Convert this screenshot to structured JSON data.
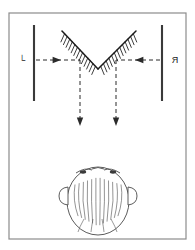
{
  "figure": {
    "type": "optics-ray-diagram",
    "canvas": {
      "width": 195,
      "height": 250
    },
    "background_color": "#ffffff",
    "frame": {
      "name": "figure-border",
      "x": 9,
      "y": 13,
      "width": 177,
      "height": 226,
      "stroke": "#8c8c8c",
      "stroke_width": 1.2,
      "fill": "none"
    },
    "ink_color": "#1a1a1a",
    "ray_color": "#2b2b2b",
    "labels": {
      "left": "└",
      "right": "Я",
      "left_name": "left-object-label-L",
      "right_name": "right-object-label-reversed-R"
    },
    "screens": [
      {
        "name": "left-screen",
        "x": 34,
        "y_top": 25,
        "y_bottom": 101,
        "stroke": "#3a3a3a",
        "stroke_width": 2.1
      },
      {
        "name": "right-screen",
        "x": 162,
        "y_top": 25,
        "y_bottom": 101,
        "stroke": "#3a3a3a",
        "stroke_width": 2.1
      }
    ],
    "mirror": {
      "name": "v-roof-mirror",
      "apex": {
        "x": 98,
        "y": 69
      },
      "left_end": {
        "x": 62,
        "y": 31
      },
      "right_end": {
        "x": 136,
        "y": 31
      },
      "stroke": "#1a1a1a",
      "stroke_width": 1.5,
      "hatch_count": 13,
      "hatch_length": 9,
      "hatch_stroke_width": 0.85,
      "hatch_side": "inner"
    },
    "rays": {
      "horizontal_axis_y": 60,
      "incoming_left": {
        "name": "incoming-ray-left",
        "x_start": 36,
        "x_end": 80,
        "direction": "right",
        "arrow_x": 58,
        "dash": "4,3"
      },
      "incoming_right": {
        "name": "incoming-ray-right",
        "x_start": 160,
        "x_end": 116,
        "direction": "left",
        "arrow_x": 138,
        "dash": "4,3"
      },
      "outgoing_left": {
        "name": "outgoing-ray-left",
        "x": 80,
        "y_start": 60,
        "y_end": 126,
        "direction": "down",
        "dash": "4,3"
      },
      "outgoing_right": {
        "name": "outgoing-ray-right",
        "x": 116,
        "y_start": 60,
        "y_end": 126,
        "direction": "down",
        "dash": "4,3"
      }
    },
    "observer": {
      "name": "observer-head-top-view",
      "description": "head viewed from above with nose and two ears",
      "center": {
        "x": 98,
        "y": 201
      },
      "radius_x": 31,
      "radius_y": 34,
      "stroke": "#4a4a4a",
      "stroke_width": 0.9,
      "fill": "#ffffff",
      "nose": {
        "x": 98,
        "y": 168
      },
      "ear_left": {
        "x": 66,
        "y": 196
      },
      "ear_right": {
        "x": 130,
        "y": 196
      },
      "hair_strands": 12
    }
  }
}
